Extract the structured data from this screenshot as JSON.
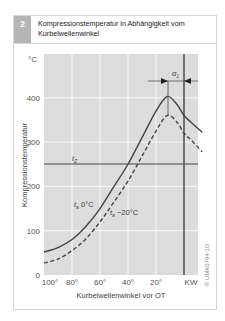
{
  "figure": {
    "number": "2",
    "title": "Kompressionstemperatur in Abhängigkeit vom Kurbelwellenwinkel",
    "credit": "© UMK0794-1D"
  },
  "chart_data": {
    "type": "line",
    "title": "Kompressionstemperatur in Abhängigkeit vom Kurbelwellenwinkel",
    "xlabel": "Kurbelwellenwinkel vor OT",
    "ylabel": "Kompressionstemperatur",
    "y_unit": "°C",
    "x_ticks": [
      "100°",
      "80°",
      "60°",
      "40°",
      "20°",
      "KW"
    ],
    "y_ticks": [
      "0",
      "100",
      "200",
      "300",
      "400"
    ],
    "x_range": [
      100,
      -13
    ],
    "ylim": [
      0,
      450
    ],
    "grid": true,
    "x": [
      100,
      90,
      80,
      70,
      60,
      50,
      40,
      30,
      20,
      12,
      5,
      0,
      -5,
      -13
    ],
    "series": [
      {
        "name": "t_a 0°C",
        "style": "solid",
        "values": [
          52,
          62,
          80,
          110,
          150,
          200,
          250,
          310,
          370,
          403,
          385,
          360,
          345,
          322
        ]
      },
      {
        "name": "t_a −20°C",
        "style": "dashed",
        "values": [
          27,
          36,
          55,
          82,
          120,
          165,
          212,
          268,
          325,
          360,
          345,
          320,
          305,
          278
        ]
      }
    ],
    "annotations": [
      {
        "text": "t_Z",
        "type": "horizontal-line",
        "y": 250
      },
      {
        "text": "KW",
        "type": "vertical-line",
        "x": 0
      },
      {
        "text": "α_1",
        "type": "dimension",
        "from_x": 12,
        "to_x": 0
      }
    ]
  }
}
